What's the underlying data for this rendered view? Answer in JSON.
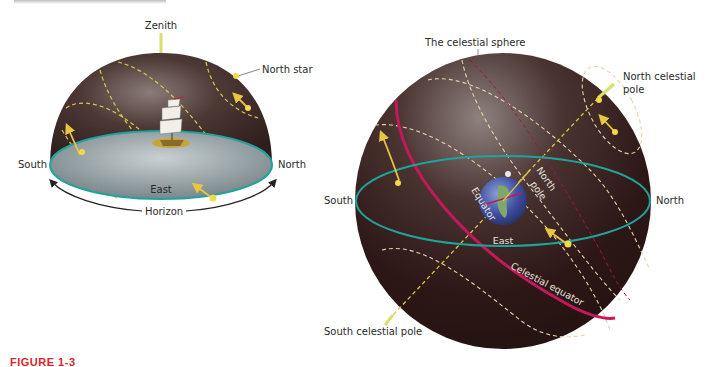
{
  "figure": {
    "label": "FIGURE 1-3"
  },
  "left_panel": {
    "zenith_label": "Zenith",
    "north_star_label": "North star",
    "south_label": "South",
    "north_label": "North",
    "east_label": "East",
    "horizon_label": "Horizon"
  },
  "right_panel": {
    "sphere_label": "The celestial sphere",
    "north_celestial_pole_label": "North celestial pole",
    "ncp_line1": "North celestial",
    "ncp_line2": "pole",
    "south_label": "South",
    "north_label": "North",
    "east_label": "East",
    "equator_label": "Equator",
    "north_pole_line1": "North",
    "north_pole_line2": "pole",
    "celestial_equator_label": "Celestial equator",
    "south_celestial_pole_label": "South celestial pole"
  },
  "colors": {
    "sky": "#3d2a28",
    "horizon_plane": "#7f8d92",
    "horizon_ring": "#1fa39a",
    "star_path": "#e8d65a",
    "star_trail_light": "#e6d3a8",
    "celestial_equator": "#c4185a",
    "figure_label": "#d9262c"
  }
}
